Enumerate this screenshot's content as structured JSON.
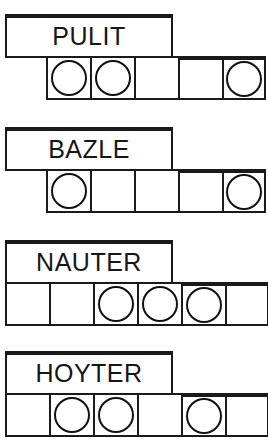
{
  "worksheet": {
    "title": "Phoneme Box Word Puzzle",
    "rows": [
      {
        "word": "PULIT",
        "label_box": {
          "x": 5,
          "y": 14,
          "width": 168,
          "height": 44
        },
        "strip": {
          "x": 46,
          "y": 56,
          "cell_width": 44,
          "cell_height": 44
        },
        "cells": [
          {
            "token": "circle",
            "filled": true
          },
          {
            "token": "circle",
            "filled": true
          },
          {
            "token": "none",
            "filled": false
          },
          {
            "token": "none",
            "filled": false
          },
          {
            "token": "circle",
            "filled": true
          }
        ],
        "token_count": 3,
        "cell_count": 5
      },
      {
        "word": "BAZLE",
        "label_box": {
          "x": 5,
          "y": 127,
          "width": 168,
          "height": 44
        },
        "strip": {
          "x": 46,
          "y": 169,
          "cell_width": 44,
          "cell_height": 44
        },
        "cells": [
          {
            "token": "circle",
            "filled": true
          },
          {
            "token": "none",
            "filled": false
          },
          {
            "token": "none",
            "filled": false
          },
          {
            "token": "none",
            "filled": false
          },
          {
            "token": "circle",
            "filled": true
          }
        ],
        "token_count": 2,
        "cell_count": 5
      },
      {
        "word": "NAUTER",
        "label_box": {
          "x": 5,
          "y": 240,
          "width": 168,
          "height": 44
        },
        "strip": {
          "x": 5,
          "y": 282,
          "cell_width": 44,
          "cell_height": 44
        },
        "cells": [
          {
            "token": "none",
            "filled": false
          },
          {
            "token": "none",
            "filled": false
          },
          {
            "token": "circle",
            "filled": true
          },
          {
            "token": "circle",
            "filled": true
          },
          {
            "token": "circle",
            "filled": true
          },
          {
            "token": "none",
            "filled": false
          }
        ],
        "token_count": 3,
        "cell_count": 6
      },
      {
        "word": "HOYTER",
        "label_box": {
          "x": 5,
          "y": 351,
          "width": 168,
          "height": 44
        },
        "strip": {
          "x": 5,
          "y": 393,
          "cell_width": 44,
          "cell_height": 44
        },
        "cells": [
          {
            "token": "none",
            "filled": false
          },
          {
            "token": "circle",
            "filled": true
          },
          {
            "token": "circle",
            "filled": true
          },
          {
            "token": "none",
            "filled": false
          },
          {
            "token": "circle",
            "filled": true
          },
          {
            "token": "none",
            "filled": false
          }
        ],
        "token_count": 3,
        "cell_count": 6
      }
    ]
  },
  "colors": {
    "ink": "#1a1a1a",
    "token_stroke": "#111111",
    "paper": "#ffffff",
    "text": "#161616"
  }
}
